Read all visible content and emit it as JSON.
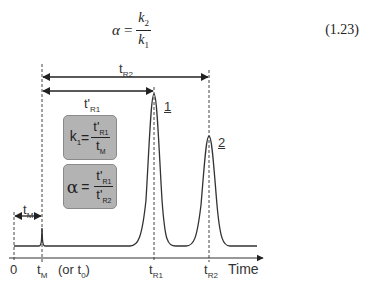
{
  "equation": {
    "lhs": "α",
    "equals": "=",
    "numerator": "k",
    "numerator_sub": "2",
    "denominator": "k",
    "denominator_sub": "1",
    "number": "(1.23)"
  },
  "diagram": {
    "arrows": {
      "tR2": {
        "label": "t",
        "sub": "R2"
      },
      "tpR1": {
        "label": "t'",
        "sub": "R1"
      },
      "tM": {
        "label": "t",
        "sub": "M"
      }
    },
    "boxes": {
      "k1": {
        "lhs": "k",
        "lhs_sub": "1",
        "equals": "=",
        "num": "t'",
        "num_sub": "R1",
        "den": "t",
        "den_sub": "M"
      },
      "alpha": {
        "lhs": "α",
        "equals": "=",
        "num": "t'",
        "num_sub": "R1",
        "den": "t'",
        "den_sub": "R2"
      }
    },
    "peaks": {
      "peak1": "1",
      "peak2": "2"
    },
    "axis": {
      "zero": "0",
      "tM": "t",
      "tM_sub": "M",
      "or_t0": "(or t",
      "or_t0_sub": "0",
      "or_t0_close": ")",
      "tR1": "t",
      "tR1_sub": "R1",
      "tR2": "t",
      "tR2_sub": "R2",
      "time": "Time"
    },
    "colors": {
      "line": "#333333",
      "box_fill": "#b3b3b3",
      "box_border": "#8a8a8a"
    }
  }
}
